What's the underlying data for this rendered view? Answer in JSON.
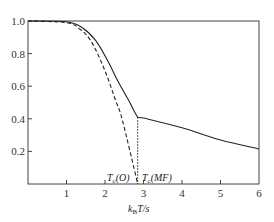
{
  "chart_data": {
    "type": "line",
    "title": "",
    "xlabel": "k_B T/s",
    "ylabel": "",
    "xlim": [
      0,
      6
    ],
    "ylim": [
      0,
      1.0
    ],
    "grid": false,
    "legend": null,
    "x_ticks": [
      "1",
      "2",
      "3",
      "4",
      "5",
      "6"
    ],
    "y_ticks": [
      "0.2",
      "0.4",
      "0.6",
      "0.8",
      "1.0"
    ],
    "series": [
      {
        "name": "solid",
        "style": "solid",
        "points": [
          [
            0,
            1.0
          ],
          [
            1.0,
            0.995
          ],
          [
            1.4,
            0.96
          ],
          [
            1.75,
            0.883
          ],
          [
            2.06,
            0.761
          ],
          [
            2.32,
            0.638
          ],
          [
            2.61,
            0.515
          ],
          [
            2.85,
            0.41
          ],
          [
            3.0,
            0.405
          ],
          [
            4.0,
            0.345
          ],
          [
            5.0,
            0.27
          ],
          [
            6.0,
            0.215
          ]
        ]
      },
      {
        "name": "dashed",
        "style": "dashed",
        "points": [
          [
            0,
            1.0
          ],
          [
            1.0,
            0.99
          ],
          [
            1.35,
            0.95
          ],
          [
            1.62,
            0.883
          ],
          [
            1.88,
            0.761
          ],
          [
            2.09,
            0.638
          ],
          [
            2.27,
            0.515
          ],
          [
            2.45,
            0.393
          ],
          [
            2.85,
            0.0
          ]
        ]
      },
      {
        "name": "dotted-vertical",
        "style": "dotted",
        "points": [
          [
            2.85,
            0.41
          ],
          [
            2.85,
            0.0
          ]
        ]
      }
    ],
    "annotations": [
      {
        "text": "T_c(O)",
        "main": "T",
        "sub": "c",
        "rest": "(O)",
        "x": 2.3,
        "y": 0.02
      },
      {
        "text": "T_c(MF)",
        "main": "T",
        "sub": "c",
        "rest": "(MF)",
        "x": 2.95,
        "y": 0.02
      }
    ]
  },
  "labels": {
    "x_axis_main": "k",
    "x_axis_sub": "B",
    "x_axis_rest": "T/s",
    "tc_o_main": "T",
    "tc_o_sub": "c",
    "tc_o_rest": "(O)",
    "tc_mf_main": "T",
    "tc_mf_sub": "c",
    "tc_mf_rest": "(MF)",
    "x_ticks": [
      "1",
      "2",
      "3",
      "4",
      "5",
      "6"
    ],
    "y_ticks": [
      "0.2",
      "0.4",
      "0.6",
      "0.8",
      "1.0"
    ]
  }
}
